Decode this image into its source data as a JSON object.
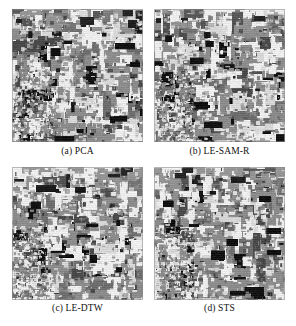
{
  "figure": {
    "kind": "classification-map-grid",
    "rows": 2,
    "columns": 2,
    "background_color": "#ffffff"
  },
  "panels": [
    {
      "id": "a",
      "caption": "(a) PCA",
      "method": "PCA",
      "position": "top-left",
      "seed": 10731
    },
    {
      "id": "b",
      "caption": "(b) LE-SAM-R",
      "method": "LE-SAM-R",
      "position": "top-right",
      "seed": 20477
    },
    {
      "id": "c",
      "caption": "(c) LE-DTW",
      "method": "LE-DTW",
      "position": "bottom-left",
      "seed": 30859
    },
    {
      "id": "d",
      "caption": "(d) STS",
      "method": "STS",
      "position": "bottom-right",
      "seed": 41213
    }
  ],
  "palette": {
    "class_light": "#ececec",
    "class_pale": "#d6d6d6",
    "class_mid": "#8c8c8c",
    "class_mid_dark": "#6e6e6e",
    "class_dark": "#4a4a4a",
    "class_black": "#121212",
    "border": "#bdbdbd"
  },
  "render": {
    "map_width_px": 131,
    "map_height_px": 133,
    "grid_cells_x": 88,
    "grid_cells_y": 90
  }
}
